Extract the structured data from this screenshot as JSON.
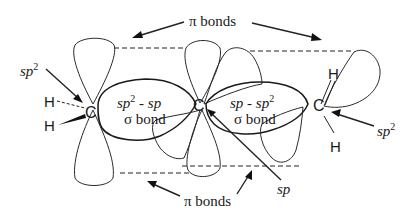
{
  "diagram": {
    "labels": {
      "pi_bonds_top": "π bonds",
      "pi_bonds_bottom": "π bonds",
      "left_sp2": "sp2",
      "right_sp2": "sp2",
      "center_sp": "sp",
      "left_sigma_line1": "sp2 - sp",
      "left_sigma_line2": "σ bond",
      "right_sigma_line1": "sp - sp2",
      "right_sigma_line2": "σ bond"
    },
    "atoms": {
      "left_carbon": "C",
      "center_carbon": "C",
      "right_carbon": "C",
      "left_h_top": "H",
      "left_h_bottom": "H",
      "right_h_top": "H",
      "right_h_bottom": "H"
    },
    "text_parts": {
      "pi": "π",
      "bonds": " bonds",
      "sp": "sp",
      "sup2": "2",
      "sigma": "σ",
      "bond": " bond",
      "dash": " - "
    }
  }
}
